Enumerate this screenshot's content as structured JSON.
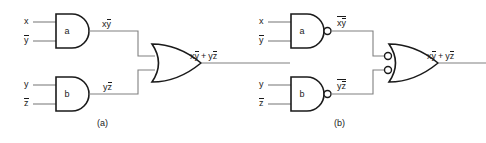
{
  "figure": {
    "background_color": "#ffffff",
    "wire_color": "#808080",
    "gate_color": "#1a1a1a"
  },
  "diagrams": [
    {
      "id": "a",
      "caption": "(a)",
      "gates": [
        {
          "name": "a",
          "label": "a",
          "type": "AND",
          "inverted_output": false,
          "inputs": [
            "x",
            "y_bar"
          ],
          "output_label_plain": "xy",
          "output_label_parts": {
            "first": "x",
            "second": "y",
            "second_bar": true,
            "outer_bar": false
          }
        },
        {
          "name": "b",
          "label": "b",
          "type": "AND",
          "inverted_output": false,
          "inputs": [
            "y",
            "z_bar"
          ],
          "output_label_plain": "yz",
          "output_label_parts": {
            "first": "y",
            "second": "z",
            "second_bar": true,
            "outer_bar": false
          }
        },
        {
          "name": "or",
          "label": "",
          "type": "OR",
          "inverted_inputs": false,
          "output_label_plain": "xy + yz"
        }
      ],
      "input_labels": [
        {
          "text": "x",
          "bar": false
        },
        {
          "text": "y",
          "bar": true
        },
        {
          "text": "y",
          "bar": false
        },
        {
          "text": "z",
          "bar": true
        }
      ],
      "output_expression": {
        "term1_first": "x",
        "term1_second": "y",
        "term1_second_bar": true,
        "operator": "+",
        "term2_first": "y",
        "term2_second": "z",
        "term2_second_bar": true
      }
    },
    {
      "id": "b",
      "caption": "(b)",
      "gates": [
        {
          "name": "a",
          "label": "a",
          "type": "NAND",
          "inverted_output": true,
          "inputs": [
            "x",
            "y_bar"
          ],
          "output_label_plain": "xy",
          "output_label_parts": {
            "first": "x",
            "second": "y",
            "second_bar": true,
            "outer_bar": true
          }
        },
        {
          "name": "b",
          "label": "b",
          "type": "NAND",
          "inverted_output": true,
          "inputs": [
            "y",
            "z_bar"
          ],
          "output_label_plain": "yz",
          "output_label_parts": {
            "first": "y",
            "second": "z",
            "second_bar": true,
            "outer_bar": true
          }
        },
        {
          "name": "or",
          "label": "",
          "type": "OR-INVERTED-INPUTS",
          "inverted_inputs": true,
          "output_label_plain": "xy + yz"
        }
      ],
      "input_labels": [
        {
          "text": "x",
          "bar": false
        },
        {
          "text": "y",
          "bar": true
        },
        {
          "text": "y",
          "bar": false
        },
        {
          "text": "z",
          "bar": true
        }
      ],
      "output_expression": {
        "term1_first": "x",
        "term1_second": "y",
        "term1_second_bar": true,
        "operator": "+",
        "term2_first": "y",
        "term2_second": "z",
        "term2_second_bar": true
      }
    }
  ],
  "text": {
    "gate_a": "a",
    "gate_b": "b",
    "caption_a": "(a)",
    "caption_b": "(b)",
    "in_x": "x",
    "in_y": "y",
    "in_y_bar": "y",
    "in_z_bar": "z",
    "plus": "+",
    "sym_x": "x",
    "sym_y": "y",
    "sym_z": "z"
  }
}
